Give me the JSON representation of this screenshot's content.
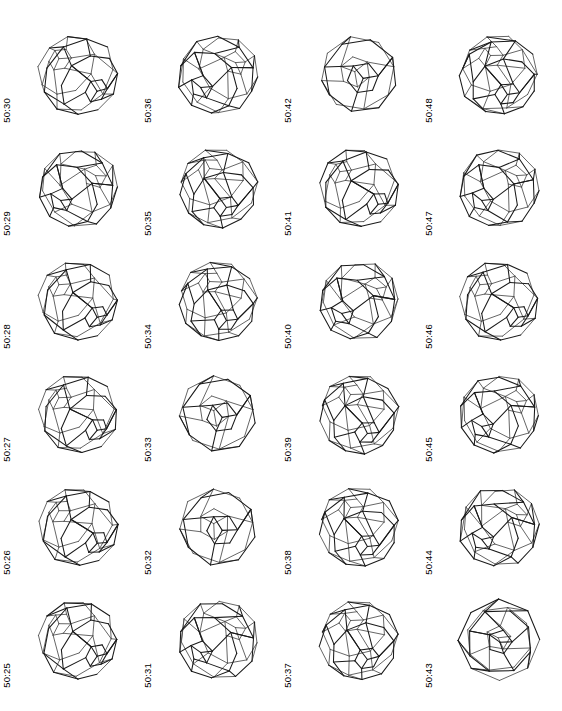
{
  "figure": {
    "kind": "fullerene-isomer-atlas-plate",
    "atom_count": 50,
    "columns": 4,
    "rows": 6,
    "line_color": "#1a1a1a",
    "background_color": "#ffffff"
  },
  "chart_data": {
    "type": "table",
    "title": "",
    "xlabel": "",
    "ylabel": "",
    "categories": [
      "50:30",
      "50:36",
      "50:42",
      "50:48",
      "50:29",
      "50:35",
      "50:41",
      "50:47",
      "50:28",
      "50:34",
      "50:40",
      "50:46",
      "50:27",
      "50:33",
      "50:39",
      "50:45",
      "50:26",
      "50:32",
      "50:38",
      "50:44",
      "50:25",
      "50:31",
      "50:37",
      "50:43"
    ],
    "values": [
      30,
      36,
      42,
      48,
      29,
      35,
      41,
      47,
      28,
      34,
      40,
      46,
      27,
      33,
      39,
      45,
      26,
      32,
      38,
      44,
      25,
      31,
      37,
      43
    ],
    "legend": [],
    "grid": false
  },
  "panels": [
    {
      "label": "50:30",
      "isomer": 30,
      "style": "tilted-a"
    },
    {
      "label": "50:36",
      "isomer": 36,
      "style": "tilted-b"
    },
    {
      "label": "50:42",
      "isomer": 42,
      "style": "frontal-sparse"
    },
    {
      "label": "50:48",
      "isomer": 48,
      "style": "tilted-c"
    },
    {
      "label": "50:29",
      "isomer": 29,
      "style": "tilted-b"
    },
    {
      "label": "50:35",
      "isomer": 35,
      "style": "tilted-c"
    },
    {
      "label": "50:41",
      "isomer": 41,
      "style": "tilted-a"
    },
    {
      "label": "50:47",
      "isomer": 47,
      "style": "tilted-b"
    },
    {
      "label": "50:28",
      "isomer": 28,
      "style": "tilted-a"
    },
    {
      "label": "50:34",
      "isomer": 34,
      "style": "tilted-c"
    },
    {
      "label": "50:40",
      "isomer": 40,
      "style": "tilted-b"
    },
    {
      "label": "50:46",
      "isomer": 46,
      "style": "tilted-a"
    },
    {
      "label": "50:27",
      "isomer": 27,
      "style": "tilted-a"
    },
    {
      "label": "50:33",
      "isomer": 33,
      "style": "frontal-sparse"
    },
    {
      "label": "50:39",
      "isomer": 39,
      "style": "tilted-c"
    },
    {
      "label": "50:45",
      "isomer": 45,
      "style": "tilted-b"
    },
    {
      "label": "50:26",
      "isomer": 26,
      "style": "tilted-a"
    },
    {
      "label": "50:32",
      "isomer": 32,
      "style": "frontal-sparse"
    },
    {
      "label": "50:38",
      "isomer": 38,
      "style": "tilted-c"
    },
    {
      "label": "50:44",
      "isomer": 44,
      "style": "tilted-b"
    },
    {
      "label": "50:25",
      "isomer": 25,
      "style": "tilted-a"
    },
    {
      "label": "50:31",
      "isomer": 31,
      "style": "tilted-b"
    },
    {
      "label": "50:37",
      "isomer": 37,
      "style": "tilted-c"
    },
    {
      "label": "50:43",
      "isomer": 43,
      "style": "frontal-symmetric"
    }
  ]
}
